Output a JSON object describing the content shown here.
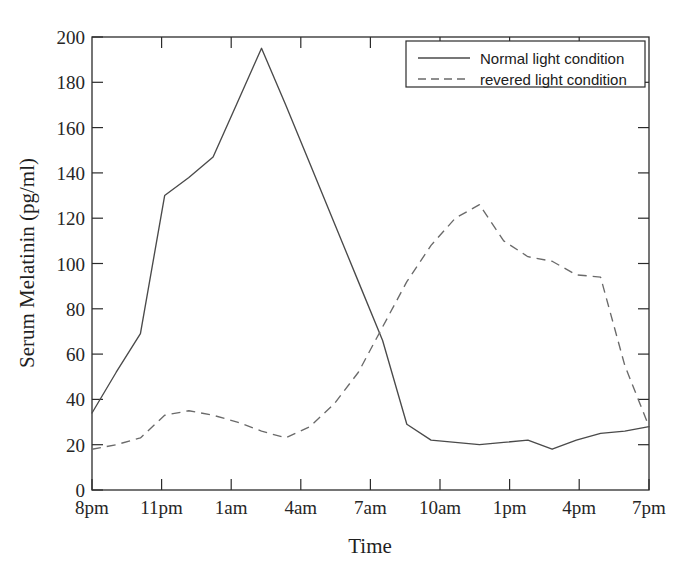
{
  "chart_data": {
    "type": "line",
    "title": "",
    "xlabel": "Time",
    "ylabel": "Serum Melatinin (pg/ml)",
    "ylim": [
      0,
      200
    ],
    "yticks": [
      0,
      20,
      40,
      60,
      80,
      100,
      120,
      140,
      160,
      180,
      200
    ],
    "xticks": [
      "8pm",
      "11pm",
      "1am",
      "4am",
      "7am",
      "10am",
      "1pm",
      "4pm",
      "7pm"
    ],
    "x": [
      "8pm",
      "9pm",
      "10pm",
      "11pm",
      "12am",
      "1am",
      "2am",
      "3am",
      "4am",
      "5am",
      "6am",
      "7am",
      "8am",
      "9am",
      "10am",
      "11am",
      "12pm",
      "1pm",
      "2pm",
      "3pm",
      "4pm",
      "5pm",
      "6pm",
      "7pm"
    ],
    "grid": false,
    "legend_position": "top-right",
    "series": [
      {
        "name": "Normal light condition",
        "style": "solid",
        "color": "#4a4a4a",
        "values": [
          34,
          52,
          69,
          130,
          138,
          147,
          171,
          195,
          170,
          144,
          118,
          92,
          66,
          29,
          22,
          21,
          20,
          21,
          22,
          18,
          22,
          25,
          26,
          28
        ]
      },
      {
        "name": "revered light condition",
        "style": "dashed",
        "color": "#6a6a6a",
        "values": [
          18,
          20,
          23,
          33,
          35,
          33,
          30,
          26,
          23,
          28,
          38,
          52,
          72,
          92,
          108,
          120,
          126,
          110,
          103,
          101,
          95,
          94,
          55,
          28
        ]
      }
    ]
  },
  "legend": {
    "entries": [
      {
        "label": "Normal light condition",
        "style": "solid"
      },
      {
        "label": "revered light condition",
        "style": "dashed"
      }
    ]
  },
  "axes": {
    "y_title": "Serum Melatinin (pg/ml)",
    "x_title": "Time",
    "y_labels": [
      "200",
      "180",
      "160",
      "140",
      "120",
      "100",
      "80",
      "60",
      "40",
      "20",
      "0"
    ],
    "x_labels": [
      "8pm",
      "11pm",
      "1am",
      "4am",
      "7am",
      "10am",
      "1pm",
      "4pm",
      "7pm"
    ]
  }
}
